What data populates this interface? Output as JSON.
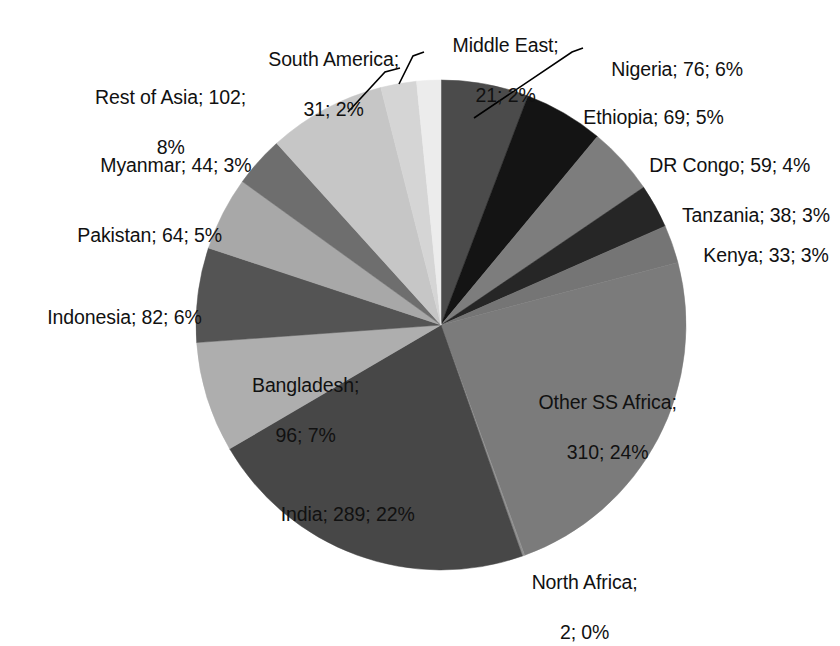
{
  "chart": {
    "type": "pie",
    "title": "",
    "center": {
      "x": 441,
      "y": 325
    },
    "radius": 245,
    "start_angle_deg": -90,
    "direction": "clockwise",
    "total": 1316
  },
  "chart_data": {
    "type": "pie",
    "title": "",
    "subtitle": "",
    "xlabel": "",
    "ylabel": "",
    "legend_position": "none",
    "grid": false,
    "label_format": "name; value; percent",
    "total": 1316,
    "categories": [
      "Nigeria",
      "Ethiopia",
      "DR Congo",
      "Tanzania",
      "Kenya",
      "Other SS Africa",
      "North Africa",
      "India",
      "Bangladesh",
      "Indonesia",
      "Pakistan",
      "Myanmar",
      "Rest of Asia",
      "South America",
      "Middle East"
    ],
    "values": [
      76,
      69,
      59,
      38,
      33,
      310,
      2,
      289,
      96,
      82,
      64,
      44,
      102,
      31,
      21
    ],
    "percents": [
      6,
      5,
      4,
      3,
      3,
      24,
      0,
      22,
      7,
      6,
      5,
      3,
      8,
      2,
      2
    ],
    "colors": [
      "#4b4b4b",
      "#141414",
      "#7d7d7d",
      "#262626",
      "#757575",
      "#7b7b7b",
      "#8f8f8f",
      "#474747",
      "#aeaeae",
      "#545454",
      "#a8a8a8",
      "#6e6e6e",
      "#c6c6c6",
      "#d5d5d5",
      "#ececec"
    ],
    "slices": [
      {
        "name": "Nigeria",
        "value": 76,
        "percent": 6,
        "label": "Nigeria; 76; 6%",
        "color": "#4b4b4b"
      },
      {
        "name": "Ethiopia",
        "value": 69,
        "percent": 5,
        "label": "Ethiopia; 69; 5%",
        "color": "#141414"
      },
      {
        "name": "DR Congo",
        "value": 59,
        "percent": 4,
        "label": "DR Congo; 59; 4%",
        "color": "#7d7d7d"
      },
      {
        "name": "Tanzania",
        "value": 38,
        "percent": 3,
        "label": "Tanzania; 38; 3%",
        "color": "#262626"
      },
      {
        "name": "Kenya",
        "value": 33,
        "percent": 3,
        "label": "Kenya; 33; 3%",
        "color": "#757575"
      },
      {
        "name": "Other SS Africa",
        "value": 310,
        "percent": 24,
        "label": "Other SS Africa; 310; 24%",
        "color": "#7b7b7b"
      },
      {
        "name": "North Africa",
        "value": 2,
        "percent": 0,
        "label": "North Africa; 2; 0%",
        "color": "#8f8f8f"
      },
      {
        "name": "India",
        "value": 289,
        "percent": 22,
        "label": "India; 289; 22%",
        "color": "#474747"
      },
      {
        "name": "Bangladesh",
        "value": 96,
        "percent": 7,
        "label": "Bangladesh; 96; 7%",
        "color": "#aeaeae"
      },
      {
        "name": "Indonesia",
        "value": 82,
        "percent": 6,
        "label": "Indonesia; 82; 6%",
        "color": "#545454"
      },
      {
        "name": "Pakistan",
        "value": 64,
        "percent": 5,
        "label": "Pakistan; 64; 5%",
        "color": "#a8a8a8"
      },
      {
        "name": "Myanmar",
        "value": 44,
        "percent": 3,
        "label": "Myanmar; 44; 3%",
        "color": "#6e6e6e"
      },
      {
        "name": "Rest of Asia",
        "value": 102,
        "percent": 8,
        "label": "Rest of Asia; 102; 8%",
        "color": "#c6c6c6"
      },
      {
        "name": "South America",
        "value": 31,
        "percent": 2,
        "label": "South America; 31; 2%",
        "color": "#d5d5d5"
      },
      {
        "name": "Middle East",
        "value": 21,
        "percent": 2,
        "label": "Middle East; 21; 2%",
        "color": "#ececec"
      }
    ]
  },
  "labels": {
    "south_america": {
      "line1": "South America;",
      "line2": "31; 2%"
    },
    "middle_east": {
      "line1": "Middle East;",
      "line2": "21; 2%"
    },
    "nigeria": {
      "line1": "Nigeria; 76; 6%"
    },
    "ethiopia": {
      "line1": "Ethiopia; 69; 5%"
    },
    "dr_congo": {
      "line1": "DR Congo; 59; 4%"
    },
    "tanzania": {
      "line1": "Tanzania; 38; 3%"
    },
    "kenya": {
      "line1": "Kenya; 33; 3%"
    },
    "rest_of_asia": {
      "line1": "Rest of Asia; 102;",
      "line2": "8%"
    },
    "myanmar": {
      "line1": "Myanmar; 44; 3%"
    },
    "pakistan": {
      "line1": "Pakistan; 64; 5%"
    },
    "indonesia": {
      "line1": "Indonesia; 82; 6%"
    },
    "bangladesh": {
      "line1": "Bangladesh;",
      "line2": "96; 7%"
    },
    "india": {
      "line1": "India; 289; 22%"
    },
    "other_ss_africa": {
      "line1": "Other SS Africa;",
      "line2": "310; 24%"
    },
    "north_africa": {
      "line1": "North Africa;",
      "line2": "2; 0%"
    }
  }
}
